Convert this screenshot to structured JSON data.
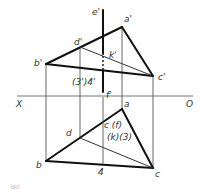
{
  "diagram": {
    "type": "orthographic projection — line piercing triangular plane",
    "axis": {
      "left_label": "X",
      "right_label": "O"
    },
    "front_view": {
      "line_top_label": "e'",
      "line_bottom_label": "f'",
      "vertices": {
        "a": "a'",
        "b": "b'",
        "c": "c'",
        "d": "d'"
      },
      "intersection_label": "k'",
      "projection_label": "(3')4'"
    },
    "top_view": {
      "vertices": {
        "a": "a",
        "b": "b",
        "c": "c",
        "d": "d"
      },
      "coincident_label_1": "c (f)",
      "coincident_label_2": "(k)(3)",
      "point_label": "4"
    },
    "caption": "图 …"
  }
}
